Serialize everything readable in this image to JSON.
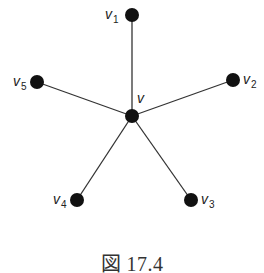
{
  "figure": {
    "caption": "図 17.4",
    "type": "star graph"
  },
  "colors": {
    "node": "#111111",
    "edge": "#333333",
    "label": "#222222",
    "background": "#ffffff"
  },
  "graph": {
    "center": {
      "id": "v",
      "label": "v",
      "subscript": "",
      "x": 132,
      "y": 116
    },
    "leaves": [
      {
        "id": "v1",
        "label": "v",
        "subscript": "1",
        "x": 132,
        "y": 15
      },
      {
        "id": "v2",
        "label": "v",
        "subscript": "2",
        "x": 233,
        "y": 80
      },
      {
        "id": "v3",
        "label": "v",
        "subscript": "3",
        "x": 191,
        "y": 200
      },
      {
        "id": "v4",
        "label": "v",
        "subscript": "4",
        "x": 77,
        "y": 200
      },
      {
        "id": "v5",
        "label": "v",
        "subscript": "5",
        "x": 37,
        "y": 82
      }
    ],
    "edges": [
      [
        "v",
        "v1"
      ],
      [
        "v",
        "v2"
      ],
      [
        "v",
        "v3"
      ],
      [
        "v",
        "v4"
      ],
      [
        "v",
        "v5"
      ]
    ]
  }
}
